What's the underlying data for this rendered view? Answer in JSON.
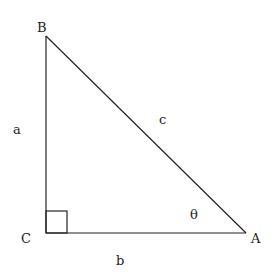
{
  "diagram": {
    "type": "right-triangle",
    "vertices": {
      "B": {
        "label": "B",
        "x": 46,
        "y": 36
      },
      "C": {
        "label": "C",
        "x": 46,
        "y": 233
      },
      "A": {
        "label": "A",
        "x": 246,
        "y": 233
      }
    },
    "sides": {
      "a": {
        "label": "a",
        "between": [
          "B",
          "C"
        ]
      },
      "b": {
        "label": "b",
        "between": [
          "C",
          "A"
        ]
      },
      "c": {
        "label": "c",
        "between": [
          "B",
          "A"
        ]
      }
    },
    "angle": {
      "label": "θ",
      "at": "A"
    },
    "right_angle_at": "C",
    "colors": {
      "stroke": "#222222",
      "background": "#ffffff"
    }
  }
}
